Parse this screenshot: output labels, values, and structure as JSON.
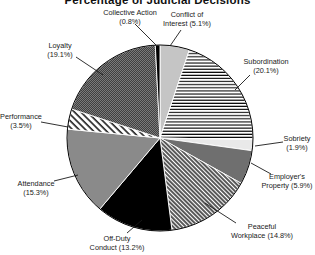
{
  "chart_data": {
    "type": "pie",
    "title": "Percentage of Judicial Decisions",
    "start_angle": "12-o'clock",
    "direction": "clockwise",
    "legend": "none (direct slice labels with leader lines)",
    "palette": {
      "black": "#000000",
      "dark_gray": "#6f6f6f",
      "mid_gray": "#8a8a8a",
      "light_gray": "#c5c5c5",
      "pale_gray": "#e9e9e9",
      "line_color": "#1a1a1a"
    },
    "slices": [
      {
        "id": "conflict-of-interest",
        "label": "Conflict of Interest",
        "value": 5.1,
        "lines": [
          "Conflict of",
          "Interest (5.1%)"
        ],
        "fill_type": "solid",
        "fill_color": "#c5c5c5",
        "label_pos": {
          "x": 187,
          "y": 10
        },
        "leader": [
          181,
          30,
          170,
          46
        ]
      },
      {
        "id": "subordination",
        "label": "Subordination",
        "value": 20.1,
        "lines": [
          "Subordination",
          "(20.1%)"
        ],
        "fill_type": "hlines",
        "fill_color": null,
        "label_pos": {
          "x": 266,
          "y": 57
        },
        "leader": [
          250,
          75,
          235,
          90
        ]
      },
      {
        "id": "sobriety",
        "label": "Sobriety",
        "value": 1.9,
        "lines": [
          "Sobriety",
          "(1.9%)"
        ],
        "fill_type": "solid",
        "fill_color": "#e9e9e9",
        "label_pos": {
          "x": 297,
          "y": 134
        },
        "leader": [
          283,
          142,
          255,
          146
        ]
      },
      {
        "id": "employers-property",
        "label": "Employer's Property",
        "value": 5.9,
        "lines": [
          "Employer's",
          "Property (5.9%)"
        ],
        "fill_type": "solid",
        "fill_color": "#6f6f6f",
        "label_pos": {
          "x": 287,
          "y": 172
        },
        "leader": [
          271,
          174,
          251,
          163
        ]
      },
      {
        "id": "peaceful-workplace",
        "label": "Peaceful Workplace",
        "value": 14.8,
        "lines": [
          "Peaceful",
          "Workplace (14.8%)"
        ],
        "fill_type": "hatch-fine",
        "fill_color": null,
        "label_pos": {
          "x": 262,
          "y": 222
        },
        "leader": [
          236,
          223,
          205,
          203
        ]
      },
      {
        "id": "off-duty-conduct",
        "label": "Off-Duty Conduct",
        "value": 13.2,
        "lines": [
          "Off-Duty",
          "Conduct (13.2%)"
        ],
        "fill_type": "solid",
        "fill_color": "#000000",
        "label_pos": {
          "x": 117,
          "y": 234
        },
        "leader": [
          127,
          233,
          142,
          220
        ]
      },
      {
        "id": "attendance",
        "label": "Attendance",
        "value": 15.3,
        "lines": [
          "Attendance",
          "(15.3%)"
        ],
        "fill_type": "solid",
        "fill_color": "#8a8a8a",
        "label_pos": {
          "x": 36,
          "y": 179
        },
        "leader": [
          54,
          181,
          78,
          175
        ]
      },
      {
        "id": "performance",
        "label": "Performance",
        "value": 3.5,
        "lines": [
          "Performance",
          "(3.5%)"
        ],
        "fill_type": "hatch-coarse",
        "fill_color": null,
        "label_pos": {
          "x": 21,
          "y": 112
        },
        "leader": [
          41,
          122,
          68,
          127
        ]
      },
      {
        "id": "loyalty",
        "label": "Loyalty",
        "value": 19.1,
        "lines": [
          "Loyalty",
          "(19.1%)"
        ],
        "fill_type": "checker",
        "fill_color": null,
        "label_pos": {
          "x": 60,
          "y": 41
        },
        "leader": [
          76,
          57,
          103,
          75
        ]
      },
      {
        "id": "collective-action",
        "label": "Collective Action",
        "value": 0.8,
        "lines": [
          "Collective Action",
          "(0.8%)"
        ],
        "fill_type": "solid",
        "fill_color": "#000000",
        "label_pos": {
          "x": 130,
          "y": 8
        },
        "leader": [
          135,
          24,
          156,
          45
        ]
      }
    ]
  }
}
